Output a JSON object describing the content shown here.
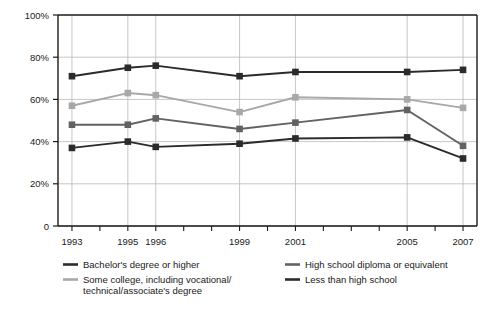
{
  "chart_data": {
    "type": "line",
    "title": "",
    "subtitle": "",
    "xlabel": "",
    "ylabel": "",
    "grid": true,
    "legend_position": "bottom",
    "ylim": [
      0,
      100
    ],
    "xlim": [
      1992.5,
      2007.5
    ],
    "ytick_labels": [
      "100%",
      "80%",
      "60%",
      "40%",
      "20%",
      "0"
    ],
    "ytick_values": [
      100,
      80,
      60,
      40,
      20,
      0
    ],
    "x": [
      1993,
      1995,
      1996,
      1999,
      2001,
      2005,
      2007
    ],
    "categories": [
      "1993",
      "1995",
      "1996",
      "1999",
      "2001",
      "2005",
      "2007"
    ],
    "xtick_labels": [
      "1993",
      "1995",
      "1996",
      "1999",
      "2001",
      "2005",
      "2007"
    ],
    "minor_tick_years": [
      1993,
      1994,
      1995,
      1996,
      1997,
      1998,
      1999,
      2000,
      2001,
      2002,
      2003,
      2004,
      2005,
      2006,
      2007
    ],
    "series": [
      {
        "name": "Bachelor's degree or higher",
        "color": "#2b2b2b",
        "marker": "square",
        "values": [
          71,
          75,
          76,
          71,
          73,
          73,
          74
        ]
      },
      {
        "name": "Some college, including vocational/technical/associate's degree",
        "color": "#a8a8a8",
        "marker": "square",
        "values": [
          57,
          63,
          62,
          54,
          61,
          60,
          56
        ]
      },
      {
        "name": "High school diploma or equivalent",
        "color": "#626262",
        "marker": "square",
        "values": [
          48,
          48,
          51,
          46,
          49,
          55,
          38
        ]
      },
      {
        "name": "Less than high school",
        "color": "#2b2b2b",
        "marker": "square",
        "values": [
          37,
          40,
          37.5,
          39,
          41.5,
          42,
          32
        ]
      }
    ]
  },
  "legend": {
    "entries": [
      {
        "label": "Bachelor's degree or higher",
        "color": "#2b2b2b"
      },
      {
        "label": "Some college, including vocational/",
        "color": "#a8a8a8"
      },
      {
        "label": "technical/associate's degree",
        "color": ""
      },
      {
        "label": "High school diploma or equivalent",
        "color": "#626262"
      },
      {
        "label": "Less than high school",
        "color": "#2b2b2b"
      }
    ]
  },
  "axis": {
    "y": {
      "labels": [
        "100%",
        "80%",
        "60%",
        "40%",
        "20%",
        "0"
      ]
    },
    "x": {
      "labels": [
        "1993",
        "1995",
        "1996",
        "1999",
        "2001",
        "2005",
        "2007"
      ]
    }
  },
  "colors": {
    "bachelors": "#2b2b2b",
    "some_college": "#a8a8a8",
    "high_school": "#626262",
    "less_than_hs": "#2b2b2b",
    "grid": "#b9b9b9",
    "axis": "#1a1a1a",
    "background": "#ffffff"
  }
}
